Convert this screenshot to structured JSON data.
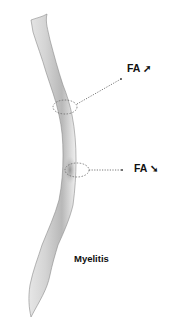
{
  "figure": {
    "colors": {
      "background": "#ffffff",
      "cord_light": "#f2f2f2",
      "cord_mid": "#c8c8c8",
      "cord_dark": "#9a9a9a",
      "outline": "#8a8a8a",
      "annotation": "#555555",
      "text": "#111111"
    }
  },
  "annotations": [
    {
      "id": "upper",
      "text": "FA",
      "arrow_icon": "arrow-up-right-icon",
      "arrow_glyph": "➚",
      "meaning": "increased"
    },
    {
      "id": "lower",
      "text": "FA",
      "arrow_icon": "arrow-down-right-icon",
      "arrow_glyph": "➘",
      "meaning": "decreased"
    }
  ],
  "caption": {
    "text": "Myelitis"
  }
}
